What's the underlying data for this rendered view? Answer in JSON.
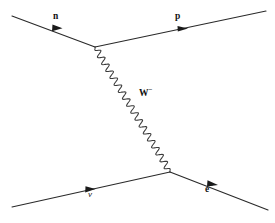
{
  "diagram": {
    "name": "feynman-diagram-inverse-beta-decay",
    "type": "feynman-diagram",
    "background_color": "#ffffff",
    "line_color": "#2a2a2a",
    "text_color": "#111111",
    "width": 275,
    "height": 223,
    "vertices": {
      "upper": {
        "x": 95,
        "y": 47
      },
      "lower": {
        "x": 170,
        "y": 172
      }
    },
    "particles": [
      {
        "id": "neutron",
        "label": "n",
        "superscript": "",
        "line_kind": "fermion",
        "from": {
          "x": 12,
          "y": 16
        },
        "to": {
          "x": 95,
          "y": 47
        },
        "arrow_at": {
          "x": 57,
          "y": 28
        },
        "label_position": {
          "x": 53,
          "y": 12
        }
      },
      {
        "id": "proton",
        "label": "p",
        "superscript": "",
        "line_kind": "fermion",
        "from": {
          "x": 95,
          "y": 47
        },
        "to": {
          "x": 266,
          "y": 11
        },
        "arrow_at": {
          "x": 182,
          "y": 29
        },
        "label_position": {
          "x": 175,
          "y": 12
        }
      },
      {
        "id": "w-boson",
        "label": "W",
        "superscript": "−",
        "line_kind": "boson-wavy",
        "from": {
          "x": 95,
          "y": 47
        },
        "to": {
          "x": 170,
          "y": 172
        },
        "arrow_at": null,
        "label_position": {
          "x": 139,
          "y": 89
        }
      },
      {
        "id": "neutrino",
        "label": "ν",
        "superscript": "",
        "line_kind": "fermion",
        "from": {
          "x": 12,
          "y": 207
        },
        "to": {
          "x": 170,
          "y": 172
        },
        "arrow_at": {
          "x": 90,
          "y": 189
        },
        "label_position": {
          "x": 88,
          "y": 190
        }
      },
      {
        "id": "electron",
        "label": "e",
        "superscript": "−",
        "line_kind": "fermion",
        "from": {
          "x": 170,
          "y": 172
        },
        "to": {
          "x": 268,
          "y": 210
        },
        "arrow_at": {
          "x": 213,
          "y": 184
        },
        "label_position": {
          "x": 205,
          "y": 185
        }
      }
    ],
    "labels": {
      "neutron": "n",
      "proton": "p",
      "w_boson": "W",
      "w_boson_charge": "−",
      "neutrino": "ν",
      "electron": "e",
      "electron_charge": "−"
    }
  }
}
